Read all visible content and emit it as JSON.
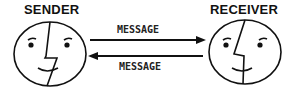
{
  "diagram": {
    "sender_label": "SENDER",
    "receiver_label": "RECEIVER",
    "forward_message": "MESSAGE",
    "return_message": "MESSAGE",
    "nodes": [
      {
        "id": "sender",
        "label": "SENDER",
        "icon": "face-icon"
      },
      {
        "id": "receiver",
        "label": "RECEIVER",
        "icon": "face-icon"
      }
    ],
    "edges": [
      {
        "from": "sender",
        "to": "receiver",
        "label": "MESSAGE"
      },
      {
        "from": "receiver",
        "to": "sender",
        "label": "MESSAGE"
      }
    ],
    "colors": {
      "stroke": "#111111",
      "background": "#ffffff"
    }
  }
}
